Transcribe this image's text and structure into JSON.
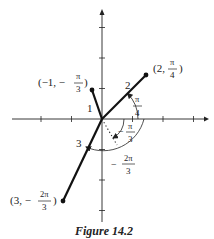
{
  "figure": {
    "caption": "Figure 14.2",
    "ink_color": "#222222"
  },
  "points": [
    {
      "id": "p1",
      "r": "2",
      "theta": "π/4",
      "r_value": 2,
      "theta_value_rad": 0.7853981634,
      "label_prefix": "(2,",
      "label_num": "π",
      "label_den": "4",
      "label_suffix": ")",
      "radius_label": "2"
    },
    {
      "id": "p2",
      "r": "-1",
      "theta": "-π/3",
      "r_value": -1,
      "theta_value_rad": -1.0471975512,
      "label_prefix": "(−1, −",
      "label_num": "π",
      "label_den": "3",
      "label_suffix": ")",
      "radius_label": "1"
    },
    {
      "id": "p3",
      "r": "3",
      "theta": "-2π/3",
      "r_value": 3,
      "theta_value_rad": -2.0943951024,
      "label_prefix": "(3, −",
      "label_num": "2π",
      "label_den": "3",
      "label_suffix": ")",
      "radius_label": "3"
    }
  ],
  "angles": [
    {
      "id": "a1",
      "num": "π",
      "den": "4",
      "sign": ""
    },
    {
      "id": "a2",
      "num": "π",
      "den": "3",
      "sign": "−"
    },
    {
      "id": "a3",
      "num": "2π",
      "den": "3",
      "sign": "−"
    }
  ]
}
